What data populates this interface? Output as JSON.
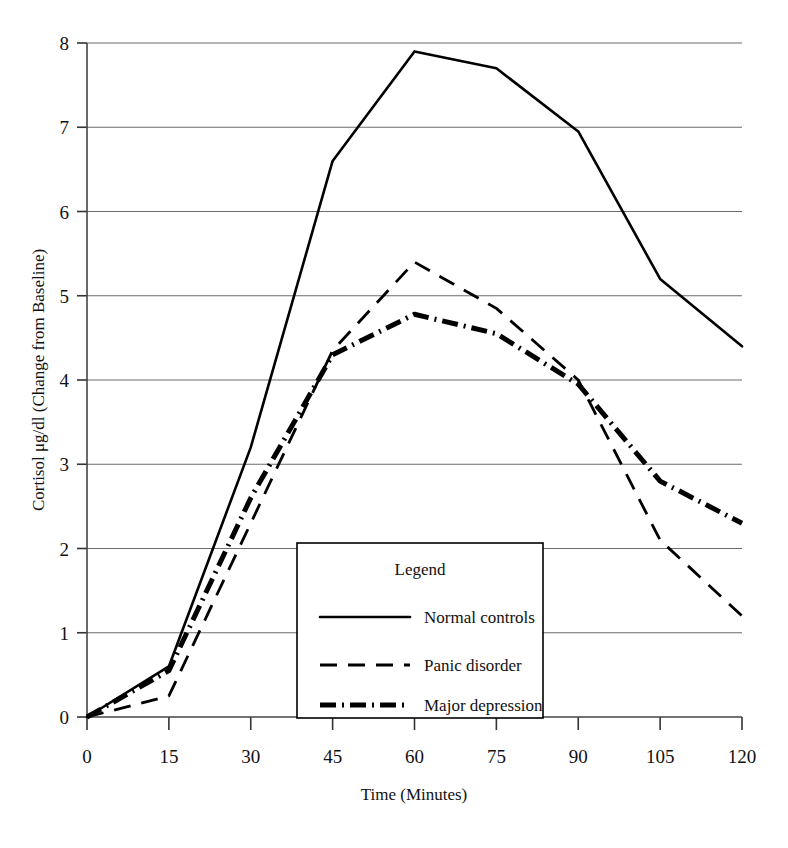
{
  "chart_data": {
    "type": "line",
    "title": "",
    "xlabel": "Time (Minutes)",
    "ylabel": "Cortisol μg/dl (Change from Baseline)",
    "x": [
      0,
      15,
      30,
      45,
      60,
      75,
      90,
      105,
      120
    ],
    "xticklabels": [
      "0",
      "15",
      "30",
      "45",
      "60",
      "75",
      "90",
      "105",
      "120"
    ],
    "yticklabels": [
      "0",
      "1",
      "2",
      "3",
      "4",
      "5",
      "6",
      "7",
      "8"
    ],
    "xlim": [
      0,
      120
    ],
    "ylim": [
      0,
      8
    ],
    "grid": "horizontal",
    "legend_position": "inside-bottom-center",
    "series": [
      {
        "name": "Normal controls",
        "style": "solid",
        "values": [
          0,
          0.6,
          3.2,
          6.6,
          7.9,
          7.7,
          6.95,
          5.2,
          4.4
        ]
      },
      {
        "name": "Panic disorder",
        "style": "dashed",
        "values": [
          0,
          0.25,
          2.3,
          4.35,
          5.4,
          4.85,
          4.0,
          2.1,
          1.2
        ]
      },
      {
        "name": "Major depression",
        "style": "dash-dot",
        "values": [
          0,
          0.55,
          2.6,
          4.3,
          4.78,
          4.55,
          3.95,
          2.8,
          2.3
        ]
      }
    ]
  },
  "legend": {
    "title": "Legend",
    "entries": [
      {
        "label": "Normal controls",
        "style": "solid"
      },
      {
        "label": "Panic disorder",
        "style": "dashed"
      },
      {
        "label": "Major depression",
        "style": "dash-dot"
      }
    ]
  },
  "colors": {
    "line": "#000000",
    "grid": "#6d6d6d",
    "axis": "#444444",
    "background": "#ffffff"
  }
}
